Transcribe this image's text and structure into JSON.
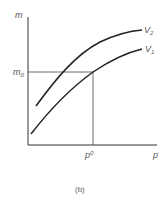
{
  "diagram": {
    "y_axis_label": "m",
    "x_axis_label": "p",
    "m0_label": "m",
    "m0_sub": "0",
    "p0_label": "p",
    "p0_sup": "0",
    "curves": [
      {
        "name": "V2",
        "label": "V",
        "sub": "2"
      },
      {
        "name": "V1",
        "label": "V",
        "sub": "1"
      }
    ],
    "caption": "(b)",
    "colors": {
      "axis": "#333333",
      "curve": "#222222",
      "label": "#555555"
    }
  }
}
